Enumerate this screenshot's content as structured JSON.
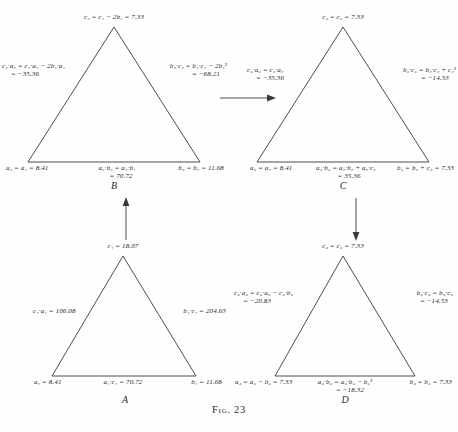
{
  "figure": {
    "caption": "Fig. 23",
    "background": "#fefefe",
    "ink": "#3a3a3a"
  },
  "triangles": {
    "A": {
      "name": "A",
      "apex": {
        "lines": [
          "c₁ = 18.07"
        ]
      },
      "left": {
        "lines": [
          "c₁·a₁ = 106.08"
        ]
      },
      "right": {
        "lines": [
          "b₁·c₁ = 204.63"
        ]
      },
      "bottom_left": {
        "lines": [
          "a₁ = 8.41"
        ]
      },
      "bottom_mid": {
        "lines": [
          "a₁·c₁ = 70.72"
        ]
      },
      "bottom_right": {
        "lines": [
          "b₁ = 11.68"
        ]
      }
    },
    "B": {
      "name": "B",
      "apex": {
        "lines": [
          "c₂ = c₁ − 2b₁ = 7.33"
        ]
      },
      "left": {
        "lines": [
          "c₂·a₂ = c₁·a₁ − 2b₁·a₁",
          "= −35.36"
        ]
      },
      "right": {
        "lines": [
          "b₂·c₂ = b₁·c₁ − 2b₁²",
          "= −68.21"
        ]
      },
      "bottom_left": {
        "lines": [
          "a₂ = a₁ = 8.41"
        ]
      },
      "bottom_mid": {
        "lines": [
          "a₂·b₂ = a₁·b₁",
          "= 70.72"
        ]
      },
      "bottom_right": {
        "lines": [
          "b₂ = b₁ = 11.68"
        ]
      }
    },
    "C": {
      "name": "C",
      "apex": {
        "lines": [
          "c₃ = c₂ = 7.33"
        ]
      },
      "left": {
        "lines": [
          "c₃·a₃ = c₂·a₂",
          "= −35.36"
        ]
      },
      "right": {
        "lines": [
          "b₃·c₃ = b₂·c₂ + c₂²",
          "= −14.53"
        ]
      },
      "bottom_left": {
        "lines": [
          "a₃ = a₂ = 8.41"
        ]
      },
      "bottom_mid": {
        "lines": [
          "a₃·b₃ = a₂·b₂ + a₂·c₂",
          "= 35.36"
        ]
      },
      "bottom_right": {
        "lines": [
          "b₃ = b₂ + c₂ = 7.33"
        ]
      }
    },
    "D": {
      "name": "D",
      "apex": {
        "lines": [
          "c₄ = c₃ = 7.33"
        ]
      },
      "left": {
        "lines": [
          "c₄·a₄ = c₃·a₃ − c₃·b₃",
          "= −20.83"
        ]
      },
      "right": {
        "lines": [
          "b₄·c₄ = b₃·c₃",
          "= −14.53"
        ]
      },
      "bottom_left": {
        "lines": [
          "a₄ = a₃ − b₃ = 7.33"
        ]
      },
      "bottom_mid": {
        "lines": [
          "a₄·b₄ = a₃·b₃ − b₃²",
          "= −18.32"
        ]
      },
      "bottom_right": {
        "lines": [
          "b₄ = b₃ = 7.33"
        ]
      }
    }
  },
  "arrows": [
    {
      "id": "arrow-b-to-c",
      "direction": "right",
      "from": "B",
      "to": "C"
    },
    {
      "id": "arrow-a-to-b",
      "direction": "up",
      "from": "A",
      "to": "B"
    },
    {
      "id": "arrow-c-to-d",
      "direction": "down",
      "from": "C",
      "to": "D"
    }
  ]
}
